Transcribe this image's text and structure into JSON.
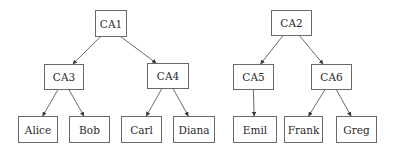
{
  "diagram": {
    "type": "tree",
    "background": "#ffffff",
    "border_color": "#6a6a6a",
    "nodes": [
      {
        "id": "CA1",
        "label": "CA1",
        "x": 95,
        "y": 10,
        "w": 31,
        "h": 26
      },
      {
        "id": "CA2",
        "label": "CA2",
        "x": 271,
        "y": 10,
        "w": 40,
        "h": 25
      },
      {
        "id": "CA3",
        "label": "CA3",
        "x": 44,
        "y": 64,
        "w": 39,
        "h": 25
      },
      {
        "id": "CA4",
        "label": "CA4",
        "x": 147,
        "y": 63,
        "w": 41,
        "h": 25
      },
      {
        "id": "CA5",
        "label": "CA5",
        "x": 233,
        "y": 64,
        "w": 40,
        "h": 25
      },
      {
        "id": "CA6",
        "label": "CA6",
        "x": 311,
        "y": 64,
        "w": 40,
        "h": 25
      },
      {
        "id": "Alice",
        "label": "Alice",
        "x": 18,
        "y": 116,
        "w": 39,
        "h": 26
      },
      {
        "id": "Bob",
        "label": "Bob",
        "x": 69,
        "y": 116,
        "w": 40,
        "h": 26
      },
      {
        "id": "Carl",
        "label": "Carl",
        "x": 121,
        "y": 116,
        "w": 40,
        "h": 26
      },
      {
        "id": "Diana",
        "label": "Diana",
        "x": 173,
        "y": 116,
        "w": 41,
        "h": 26
      },
      {
        "id": "Emil",
        "label": "Emil",
        "x": 233,
        "y": 116,
        "w": 43,
        "h": 26
      },
      {
        "id": "Frank",
        "label": "Frank",
        "x": 284,
        "y": 116,
        "w": 38,
        "h": 26
      },
      {
        "id": "Greg",
        "label": "Greg",
        "x": 336,
        "y": 116,
        "w": 40,
        "h": 26
      }
    ],
    "edges": [
      {
        "from": "CA1",
        "to": "CA3"
      },
      {
        "from": "CA1",
        "to": "CA4"
      },
      {
        "from": "CA3",
        "to": "Alice"
      },
      {
        "from": "CA3",
        "to": "Bob"
      },
      {
        "from": "CA4",
        "to": "Carl"
      },
      {
        "from": "CA4",
        "to": "Diana"
      },
      {
        "from": "CA2",
        "to": "CA5"
      },
      {
        "from": "CA2",
        "to": "CA6"
      },
      {
        "from": "CA5",
        "to": "Emil"
      },
      {
        "from": "CA6",
        "to": "Frank"
      },
      {
        "from": "CA6",
        "to": "Greg"
      }
    ]
  }
}
